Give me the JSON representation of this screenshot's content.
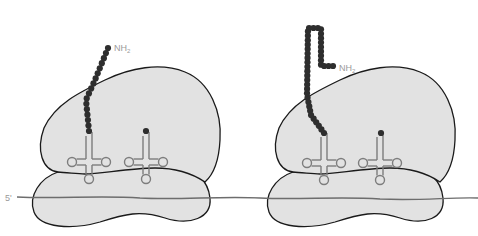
{
  "figure": {
    "panels": [
      {
        "id": "left",
        "chain_label_main": "NH",
        "chain_label_sub": "2",
        "chain_residue_count": 17,
        "trna_sites": 2
      },
      {
        "id": "right",
        "chain_label_main": "NH",
        "chain_label_sub": "2",
        "chain_residue_count": 40,
        "trna_sites": 2
      }
    ],
    "mrna_label": "5'",
    "colors": {
      "ribosome_fill": "#e2e2e2",
      "outline": "#1a1a1a",
      "bead": "#2e2e2e",
      "trna": "#7d7d7d",
      "label": "#9a9a9a"
    }
  }
}
